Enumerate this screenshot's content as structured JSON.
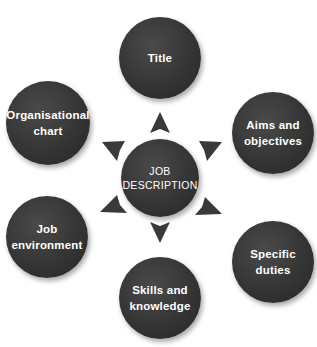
{
  "diagram": {
    "center": {
      "line1": "JOB",
      "line2": "DESCRIPTION"
    },
    "nodes": [
      {
        "id": "title",
        "line1": "Title",
        "line2": ""
      },
      {
        "id": "aims",
        "line1": "Aims and",
        "line2": "objectives"
      },
      {
        "id": "duties",
        "line1": "Specific",
        "line2": "duties"
      },
      {
        "id": "skills",
        "line1": "Skills and",
        "line2": "knowledge"
      },
      {
        "id": "environment",
        "line1": "Job",
        "line2": "environment"
      },
      {
        "id": "org",
        "line1": "Organisational",
        "line2": "chart"
      }
    ],
    "colors": {
      "node_fill": "#333333",
      "text": "#ffffff",
      "arrow": "#3a3a3a",
      "background": "#ffffff"
    }
  }
}
